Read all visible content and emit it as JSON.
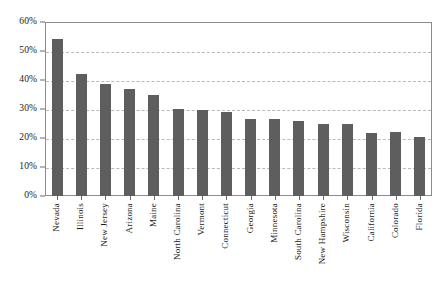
{
  "chart_data": {
    "type": "bar",
    "title": "",
    "subtitle": "",
    "xlabel": "",
    "ylabel": "",
    "ylim": [
      0,
      60
    ],
    "ytick_labels": [
      "0%",
      "10%",
      "20%",
      "30%",
      "40%",
      "50%",
      "60%"
    ],
    "ytick_values": [
      0,
      10,
      20,
      30,
      40,
      50,
      60
    ],
    "grid": true,
    "legend": null,
    "bar_color": "#5e5e5e",
    "categories": [
      "Nevada",
      "Illinois",
      "New Jersey",
      "Arizona",
      "Maine",
      "North Carolina",
      "Vermont",
      "Connecticut",
      "Georgia",
      "Minnesota",
      "South Carolina",
      "New Hampshire",
      "Wisconsin",
      "California",
      "Colorado",
      "Florida"
    ],
    "values": [
      54,
      42,
      38.5,
      37,
      35,
      30,
      29.8,
      29,
      26.5,
      26.5,
      26,
      25,
      24.8,
      21.8,
      22,
      20.5
    ]
  }
}
